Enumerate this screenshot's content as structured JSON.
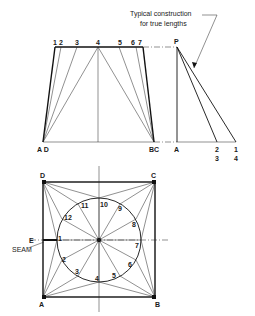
{
  "annotation": {
    "line1": "Typical construction",
    "line2": "for true lengths"
  },
  "elevation": {
    "top_labels": [
      "1",
      "2",
      "3",
      "4",
      "5",
      "6",
      "7"
    ],
    "bottom_left": "A D",
    "bottom_right": "BC",
    "apex": "P",
    "base_A": "A",
    "base_23_top": "2",
    "base_23_bot": "3",
    "base_14_top": "1",
    "base_14_bot": "4"
  },
  "plan": {
    "corners": {
      "D": "D",
      "C": "C",
      "A": "A",
      "B": "B"
    },
    "E": "E",
    "seam": "SEAM",
    "points": [
      "1",
      "2",
      "3",
      "4",
      "5",
      "6",
      "7",
      "8",
      "9",
      "10",
      "11",
      "12"
    ]
  }
}
